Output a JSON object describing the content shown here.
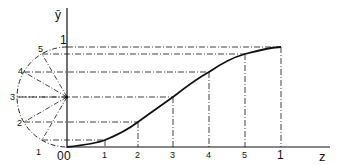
{
  "diagram": {
    "axis_y_label": "ȳ",
    "axis_x_label": "z",
    "y_top_label": "1",
    "origin_labels": [
      "0",
      "0"
    ],
    "x_ticks": [
      {
        "label": "1",
        "x": 105
      },
      {
        "label": "2",
        "x": 138
      },
      {
        "label": "3",
        "x": 173
      },
      {
        "label": "4",
        "x": 209
      },
      {
        "label": "5",
        "x": 245
      },
      {
        "label": "1",
        "x": 281
      }
    ],
    "circle_points": [
      {
        "label": "1",
        "x": 44,
        "y": 141
      },
      {
        "label": "2",
        "x": 27,
        "y": 122
      },
      {
        "label": "3",
        "x": 17,
        "y": 97
      },
      {
        "label": "4",
        "x": 27,
        "y": 72
      },
      {
        "label": "5",
        "x": 44,
        "y": 54
      }
    ],
    "colors": {
      "line": "#111111",
      "background": "#ffffff"
    }
  }
}
